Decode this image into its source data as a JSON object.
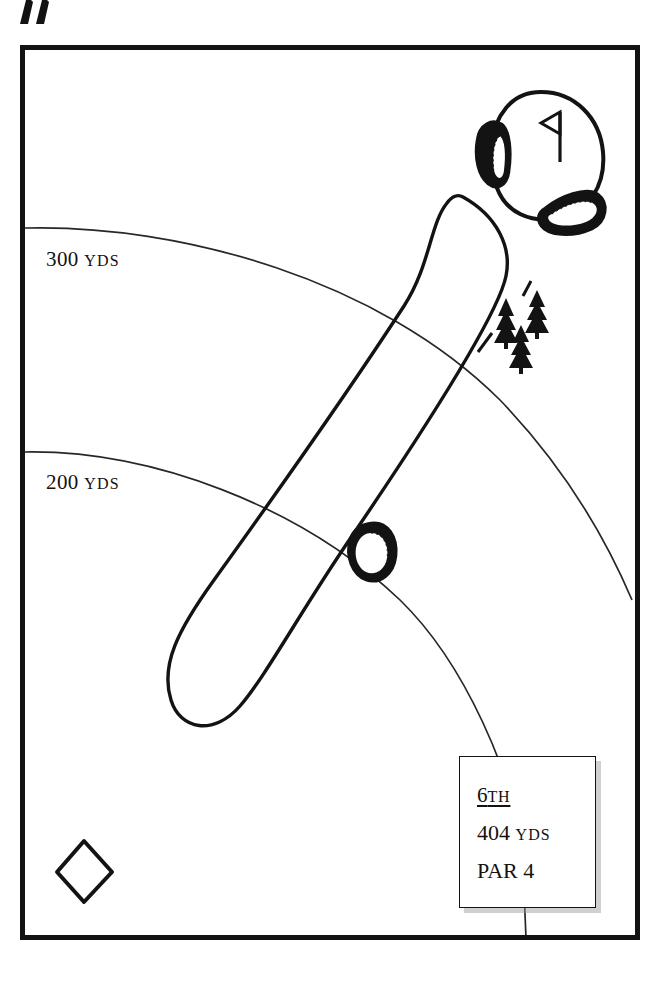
{
  "diagram": {
    "type": "golf-hole-map",
    "north_arrow": "north-arrow-icon"
  },
  "yardage_arcs": [
    {
      "label_number": "300",
      "label_unit": "YDS",
      "id": "arc-300"
    },
    {
      "label_number": "200",
      "label_unit": "YDS",
      "id": "arc-200"
    }
  ],
  "hole_info": {
    "number": "6",
    "ordinal": "TH",
    "distance": "404",
    "distance_unit": "YDS",
    "par_word": "PAR",
    "par_value": "4"
  },
  "features": {
    "green": "putting-green",
    "flag": "pin-flag-icon",
    "tee_box": "tee-box-marker",
    "fairway": "fairway-outline",
    "bunkers": [
      "green-side-bunker-left",
      "green-side-bunker-right",
      "fairway-bunker"
    ],
    "trees": [
      "tree-icon-1",
      "tree-icon-2",
      "tree-icon-3"
    ]
  },
  "colors": {
    "ink": "#131313",
    "paper": "#ffffff",
    "hairline": "#2a2623",
    "shadow": "rgba(150,150,150,0.45)"
  }
}
